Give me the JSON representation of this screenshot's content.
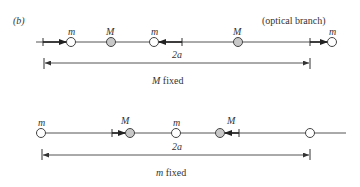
{
  "figure": {
    "panel_label": "(b)",
    "top": {
      "branch_label": "(optical branch)",
      "masses": [
        {
          "label": "m",
          "type": "light",
          "x": 71
        },
        {
          "label": "M",
          "type": "heavy",
          "x": 111
        },
        {
          "label": "m",
          "type": "light",
          "x": 154
        },
        {
          "label": "M",
          "type": "heavy",
          "x": 238
        },
        {
          "label": "m",
          "type": "light",
          "x": 332
        }
      ],
      "dimension_label": "2a",
      "caption_italic": "M",
      "caption_rest": " fixed"
    },
    "bottom": {
      "masses": [
        {
          "label": "m",
          "type": "light",
          "x": 41
        },
        {
          "label": "M",
          "type": "heavy",
          "x": 130
        },
        {
          "label": "m",
          "type": "light",
          "x": 176
        },
        {
          "label": "M",
          "type": "heavy",
          "x": 220
        },
        {
          "label": "",
          "type": "light",
          "x": 310
        }
      ],
      "dimension_label": "2a",
      "caption_italic": "m",
      "caption_rest": " fixed"
    },
    "colors": {
      "line": "#555555",
      "light_mass_fill": "#ffffff",
      "heavy_mass_fill": "#c8c8c8",
      "stroke": "#444444"
    }
  }
}
